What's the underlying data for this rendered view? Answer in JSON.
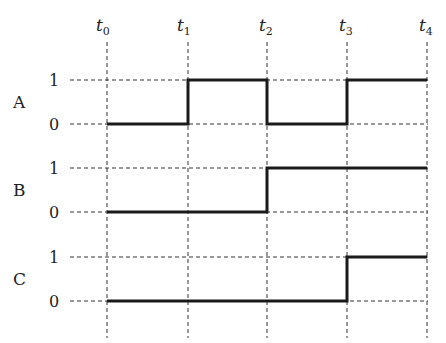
{
  "diagram": {
    "type": "timing-diagram",
    "time_labels": [
      {
        "base": "t",
        "sub": "0"
      },
      {
        "base": "t",
        "sub": "1"
      },
      {
        "base": "t",
        "sub": "2"
      },
      {
        "base": "t",
        "sub": "3"
      },
      {
        "base": "t",
        "sub": "4"
      }
    ],
    "signals": [
      {
        "name": "A",
        "high_label": "1",
        "low_label": "0",
        "levels": [
          0,
          1,
          0,
          1
        ]
      },
      {
        "name": "B",
        "high_label": "1",
        "low_label": "0",
        "levels": [
          0,
          0,
          1,
          1
        ]
      },
      {
        "name": "C",
        "high_label": "1",
        "low_label": "0",
        "levels": [
          0,
          0,
          0,
          1
        ]
      }
    ],
    "colors": {
      "wave": "#1a1a1a",
      "grid": "#333333",
      "text": "#222222"
    }
  }
}
